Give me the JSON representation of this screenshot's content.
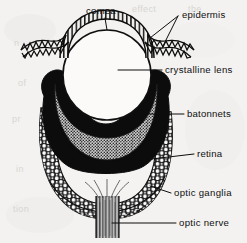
{
  "figure": {
    "kind": "anatomical-diagram",
    "background_color": "#f3f2f0",
    "ink_color": "#101010",
    "labels": [
      {
        "id": "cornea",
        "text": "comea",
        "x": 101,
        "y": 14,
        "anchor": "middle"
      },
      {
        "id": "epidermis",
        "text": "epidermis",
        "x": 182,
        "y": 18,
        "anchor": "start"
      },
      {
        "id": "crystalline-lens",
        "text": "crystalline  lens",
        "x": 165,
        "y": 73,
        "anchor": "start"
      },
      {
        "id": "batonnets",
        "text": "batonnets",
        "x": 187,
        "y": 117,
        "anchor": "start"
      },
      {
        "id": "retina",
        "text": "retina",
        "x": 197,
        "y": 157,
        "anchor": "start"
      },
      {
        "id": "optic-ganglia",
        "text": "optic  ganglia",
        "x": 174,
        "y": 196,
        "anchor": "start"
      },
      {
        "id": "optic-nerve",
        "text": "optic  nerve",
        "x": 179,
        "y": 226,
        "anchor": "start"
      }
    ],
    "bleed_through_text": [
      {
        "text": "effect",
        "x": 132,
        "y": 12,
        "size": 10
      },
      {
        "text": "the",
        "x": 188,
        "y": 12,
        "size": 10
      },
      {
        "text": "n",
        "x": 14,
        "y": 46,
        "size": 9
      },
      {
        "text": "of",
        "x": 18,
        "y": 86,
        "size": 9
      },
      {
        "text": "pr",
        "x": 12,
        "y": 122,
        "size": 9
      },
      {
        "text": "in",
        "x": 16,
        "y": 172,
        "size": 9
      },
      {
        "text": "tion",
        "x": 13,
        "y": 212,
        "size": 9
      }
    ],
    "parts": {
      "cornea": {
        "description": "transparent dome over lens"
      },
      "epidermis": {
        "description": "zig-zag wavy skin band flanking cornea"
      },
      "crystalline_lens": {
        "description": "large white ovoid lens",
        "fill": "#fbfaf8"
      },
      "pigment_layer": {
        "description": "solid black pigment cup",
        "fill": "#0c0c0c"
      },
      "batonnets": {
        "description": "finely stippled crescent of rhabdoms",
        "fill": "#8d8d8d"
      },
      "retina": {
        "description": "cobblestone cell layer",
        "fill": "#ffffff"
      },
      "optic_ganglia": {
        "description": "cell band below retina"
      },
      "optic_nerve": {
        "description": "vertical striated nerve trunk",
        "fill": "#8a8a8a"
      }
    }
  }
}
